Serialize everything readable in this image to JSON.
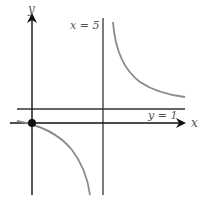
{
  "diagram": {
    "type": "graph-of-rational-function",
    "axes": {
      "x_label": "x",
      "y_label": "y"
    },
    "asymptotes": {
      "vertical": {
        "label": "x = 5",
        "value": 5
      },
      "horizontal": {
        "label": "y = 1",
        "value": 1
      }
    },
    "point": {
      "label": "origin",
      "x": 0,
      "y": 0
    },
    "colors": {
      "axes": "#222222",
      "asymptote": "#333333",
      "curve": "#8a8a8a",
      "label": "#555555"
    }
  }
}
